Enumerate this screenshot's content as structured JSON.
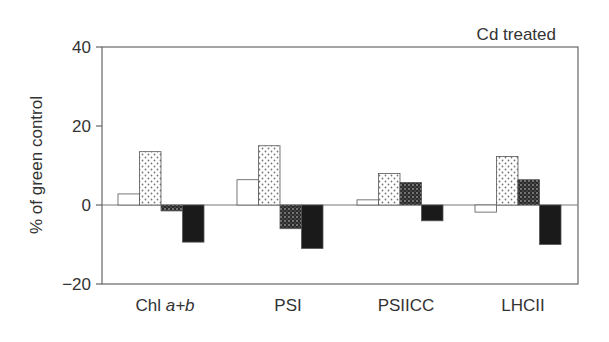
{
  "chart_data": {
    "type": "bar",
    "title": "Cd treated",
    "xlabel": "",
    "ylabel": "% of green control",
    "ylim": [
      -20,
      40
    ],
    "yticks": [
      -20,
      0,
      20,
      40
    ],
    "ytick_labels": [
      "−20",
      "0",
      "20",
      "40"
    ],
    "grid": false,
    "legend": null,
    "categories": [
      "Chl a+b",
      "PSI",
      "PSIICC",
      "LHCII"
    ],
    "category_labels": [
      {
        "plain": "Chl ",
        "italic": "a+b"
      },
      {
        "plain": "PSI",
        "italic": ""
      },
      {
        "plain": "PSIICC",
        "italic": ""
      },
      {
        "plain": "LHCII",
        "italic": ""
      }
    ],
    "series": [
      {
        "name": "series 1 (open)",
        "pattern": "white",
        "values": [
          2.8,
          6.4,
          1.3,
          -1.8
        ]
      },
      {
        "name": "series 2 (light stipple)",
        "pattern": "light-dots",
        "values": [
          13.5,
          15.0,
          8.0,
          12.3
        ]
      },
      {
        "name": "series 3 (dense stipple)",
        "pattern": "dense-dots",
        "values": [
          -1.5,
          -6.0,
          5.7,
          6.4
        ]
      },
      {
        "name": "series 4 (solid black)",
        "pattern": "black",
        "values": [
          -9.4,
          -11.0,
          -4.0,
          -10.0
        ]
      }
    ]
  },
  "colors": {
    "axis": "#555555",
    "text": "#333333",
    "black_bar": "#1a1a1a"
  }
}
